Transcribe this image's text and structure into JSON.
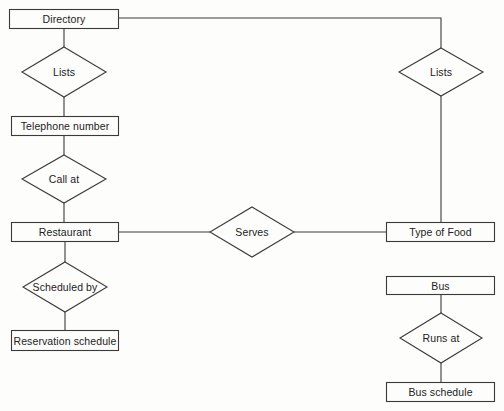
{
  "diagram": {
    "type": "entity-relationship",
    "colors": {
      "stroke": "#3a3a3a",
      "text": "#222222",
      "background": "#fdfdfc"
    },
    "entities": [
      {
        "id": "directory",
        "label": "Directory",
        "x": 9,
        "y": 9,
        "w": 109,
        "h": 19
      },
      {
        "id": "telephone",
        "label": "Telephone number",
        "x": 11,
        "y": 116,
        "w": 107,
        "h": 19
      },
      {
        "id": "restaurant",
        "label": "Restaurant",
        "x": 11,
        "y": 222,
        "w": 107,
        "h": 19
      },
      {
        "id": "reservation",
        "label": "Reservation schedule",
        "x": 11,
        "y": 330,
        "w": 107,
        "h": 20
      },
      {
        "id": "typeoffood",
        "label": "Type of Food",
        "x": 386,
        "y": 222,
        "w": 108,
        "h": 19
      },
      {
        "id": "bus",
        "label": "Bus",
        "x": 386,
        "y": 276,
        "w": 108,
        "h": 18
      },
      {
        "id": "busschedule",
        "label": "Bus schedule",
        "x": 386,
        "y": 382,
        "w": 108,
        "h": 19
      }
    ],
    "relationships": [
      {
        "id": "lists-left",
        "label": "Lists",
        "cx": 64,
        "cy": 72,
        "hw": 42,
        "hh": 25
      },
      {
        "id": "callat",
        "label": "Call at",
        "cx": 64,
        "cy": 179,
        "hw": 42,
        "hh": 24
      },
      {
        "id": "scheduledby",
        "label": "Scheduled by",
        "cx": 65,
        "cy": 287,
        "hw": 42,
        "hh": 25
      },
      {
        "id": "lists-right",
        "label": "Lists",
        "cx": 441,
        "cy": 72,
        "hw": 42,
        "hh": 24
      },
      {
        "id": "serves",
        "label": "Serves",
        "cx": 252,
        "cy": 232,
        "hw": 42,
        "hh": 25
      },
      {
        "id": "runsat",
        "label": "Runs at",
        "cx": 441,
        "cy": 338,
        "hw": 41,
        "hh": 25
      }
    ],
    "connectors": [
      {
        "from": "directory",
        "to": "lists-left",
        "points": [
          [
            64,
            28
          ],
          [
            64,
            47
          ]
        ]
      },
      {
        "from": "lists-left",
        "to": "telephone",
        "points": [
          [
            64,
            97
          ],
          [
            64,
            116
          ]
        ]
      },
      {
        "from": "telephone",
        "to": "callat",
        "points": [
          [
            64,
            135
          ],
          [
            64,
            155
          ]
        ]
      },
      {
        "from": "callat",
        "to": "restaurant",
        "points": [
          [
            64,
            203
          ],
          [
            64,
            222
          ]
        ]
      },
      {
        "from": "restaurant",
        "to": "scheduledby",
        "points": [
          [
            65,
            241
          ],
          [
            65,
            262
          ]
        ]
      },
      {
        "from": "scheduledby",
        "to": "reservation",
        "points": [
          [
            65,
            312
          ],
          [
            65,
            330
          ]
        ]
      },
      {
        "from": "directory",
        "to": "lists-right",
        "points": [
          [
            118,
            18
          ],
          [
            441,
            18
          ],
          [
            441,
            48
          ]
        ]
      },
      {
        "from": "lists-right",
        "to": "typeoffood",
        "points": [
          [
            441,
            96
          ],
          [
            441,
            222
          ]
        ]
      },
      {
        "from": "restaurant",
        "to": "serves",
        "points": [
          [
            118,
            232
          ],
          [
            210,
            232
          ]
        ]
      },
      {
        "from": "serves",
        "to": "typeoffood",
        "points": [
          [
            294,
            232
          ],
          [
            386,
            232
          ]
        ]
      },
      {
        "from": "bus",
        "to": "runsat",
        "points": [
          [
            441,
            294
          ],
          [
            441,
            313
          ]
        ]
      },
      {
        "from": "runsat",
        "to": "busschedule",
        "points": [
          [
            441,
            363
          ],
          [
            441,
            382
          ]
        ]
      }
    ]
  }
}
